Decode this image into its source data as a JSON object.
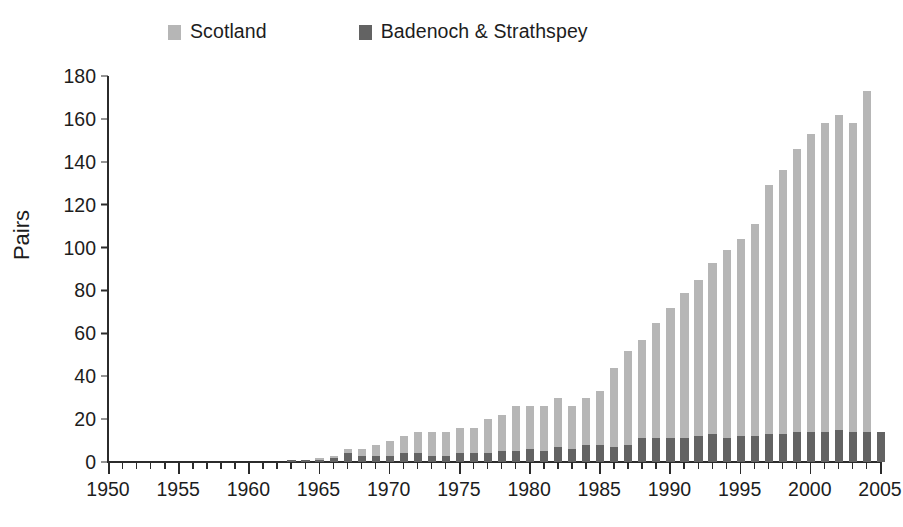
{
  "chart_data": {
    "type": "bar",
    "subtype": "grouped-overlay",
    "title": "",
    "xlabel": "",
    "ylabel": "Pairs",
    "ylim": [
      0,
      180
    ],
    "ytick_step": 20,
    "yticks": [
      0,
      20,
      40,
      60,
      80,
      100,
      120,
      140,
      160,
      180
    ],
    "xlim": [
      1950,
      2005
    ],
    "xtick_major": [
      1950,
      1955,
      1960,
      1965,
      1970,
      1975,
      1980,
      1985,
      1990,
      1995,
      2000,
      2005
    ],
    "xtick_minor_step": 1,
    "grid": false,
    "legend_position": "top",
    "colors": {
      "scotland": "#b6b6b6",
      "badenoch": "#636363",
      "axis": "#2b2b2b",
      "text": "#1d1d1d",
      "background": "#ffffff"
    },
    "legend": [
      {
        "label": "Scotland",
        "color": "#b6b6b6"
      },
      {
        "label": "Badenoch & Strathspey",
        "color": "#636363"
      }
    ],
    "categories": [
      1950,
      1951,
      1952,
      1953,
      1954,
      1955,
      1956,
      1957,
      1958,
      1959,
      1960,
      1961,
      1962,
      1963,
      1964,
      1965,
      1966,
      1967,
      1968,
      1969,
      1970,
      1971,
      1972,
      1973,
      1974,
      1975,
      1976,
      1977,
      1978,
      1979,
      1980,
      1981,
      1982,
      1983,
      1984,
      1985,
      1986,
      1987,
      1988,
      1989,
      1990,
      1991,
      1992,
      1993,
      1994,
      1995,
      1996,
      1997,
      1998,
      1999,
      2000,
      2001,
      2002,
      2003,
      2004,
      2005
    ],
    "series": [
      {
        "name": "Scotland",
        "color": "#b6b6b6",
        "values": [
          0,
          0,
          0,
          0,
          0,
          0,
          0,
          0,
          0,
          0,
          0,
          0,
          0,
          1,
          1,
          2,
          3,
          6,
          6,
          8,
          10,
          12,
          14,
          14,
          14,
          16,
          16,
          20,
          22,
          26,
          26,
          26,
          30,
          26,
          30,
          33,
          44,
          52,
          57,
          65,
          72,
          79,
          85,
          93,
          99,
          104,
          111,
          129,
          136,
          146,
          153,
          158,
          162,
          158,
          173,
          0
        ]
      },
      {
        "name": "Badenoch & Strathspey",
        "color": "#636363",
        "values": [
          0,
          0,
          0,
          0,
          0,
          0,
          0,
          0,
          0,
          0,
          0,
          0,
          0,
          1,
          1,
          1,
          2,
          4,
          3,
          3,
          3,
          4,
          4,
          3,
          3,
          4,
          4,
          4,
          5,
          5,
          6,
          5,
          7,
          6,
          8,
          8,
          7,
          8,
          11,
          11,
          11,
          11,
          12,
          13,
          11,
          12,
          12,
          13,
          13,
          14,
          14,
          14,
          15,
          14,
          14,
          14
        ]
      }
    ]
  }
}
